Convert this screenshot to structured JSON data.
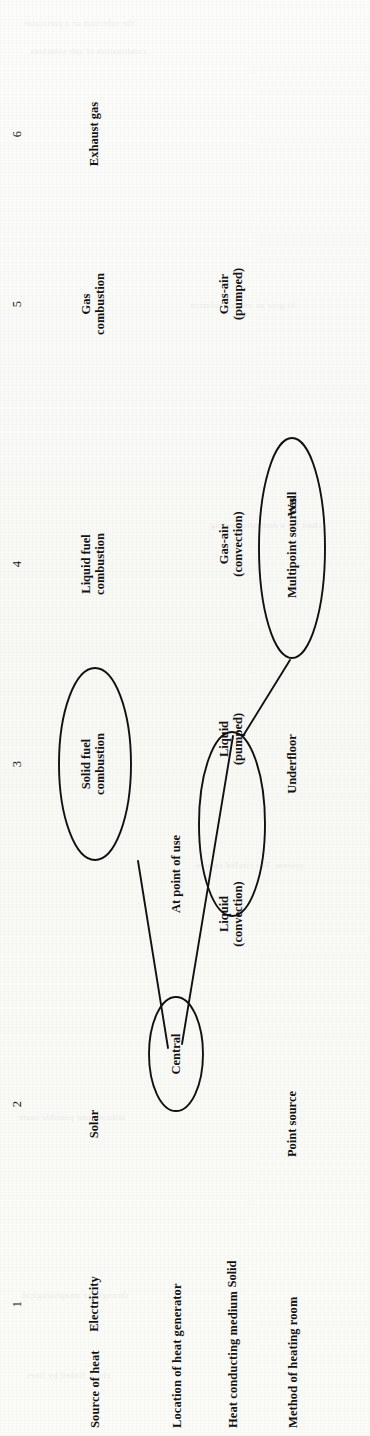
{
  "figure": {
    "kind": "morphological-chart",
    "orientation": "rotated-90-ccw",
    "row_labels": [
      "Source of heat",
      "Location of heat generator",
      "Heat conducting medium",
      "Method of heating room"
    ],
    "column_numbers": [
      "1",
      "2",
      "3",
      "4",
      "5",
      "6"
    ],
    "rows": [
      {
        "label": "Source of heat",
        "cells": [
          {
            "col": 1,
            "text": "Electricity",
            "circled": false
          },
          {
            "col": 2,
            "text": "Solar",
            "circled": false
          },
          {
            "col": 3,
            "text": "Solid fuel\ncombustion",
            "circled": true
          },
          {
            "col": 4,
            "text": "Liquid fuel\ncombustion",
            "circled": false
          },
          {
            "col": 5,
            "text": "Gas\ncombustion",
            "circled": false
          },
          {
            "col": 6,
            "text": "Exhaust gas",
            "circled": false
          }
        ]
      },
      {
        "label": "Location of heat generator",
        "cells": [
          {
            "col": 1,
            "text": "Central",
            "circled": true
          },
          {
            "col": 2,
            "text": "At point of use",
            "circled": false
          }
        ]
      },
      {
        "label": "Heat conducting medium",
        "cells": [
          {
            "col": 1,
            "text": "Solid",
            "circled": false
          },
          {
            "col": 2,
            "text": "Liquid\n(convection)",
            "circled": false
          },
          {
            "col": 3,
            "text": "Liquid\n(pumped)",
            "circled": true
          },
          {
            "col": 4,
            "text": "Gas-air\n(convection)",
            "circled": false
          },
          {
            "col": 5,
            "text": "Gas-air\n(pumped)",
            "circled": false
          }
        ]
      },
      {
        "label": "Method of heating room",
        "cells": [
          {
            "col": 1,
            "text": "Point source",
            "circled": false
          },
          {
            "col": 2,
            "text": "Multipoint sources",
            "circled": true
          },
          {
            "col": 3,
            "text": "Underfloor",
            "circled": false
          },
          {
            "col": 4,
            "text": "Wall",
            "circled": false
          }
        ]
      }
    ],
    "solution_path": [
      {
        "from": "Solid fuel combustion",
        "to": "Central"
      },
      {
        "from": "Central",
        "to": "Liquid (pumped)"
      },
      {
        "from": "Liquid (pumped)",
        "to": "Multipoint sources"
      }
    ],
    "ink_color": "#111111",
    "paper_color": "#fbfbf9"
  },
  "bleed_through": [
    "the selection of a particular",
    "combination of sub-solutions",
    "to give an overall solution",
    "chart for a domestic heating",
    "system. The circled entries",
    "indicate one possible route",
    "through the morphological",
    "chart, linked by lines"
  ]
}
